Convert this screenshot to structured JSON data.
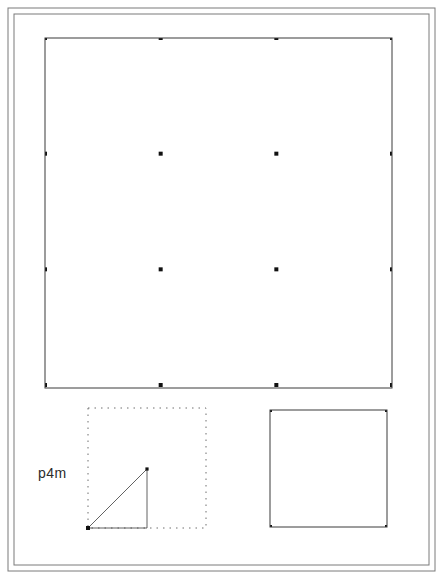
{
  "plate": {
    "title": "Islamic geometric pattern plate",
    "background_color": "#ffffff",
    "ink_color": "#3a3a3a",
    "frame": {
      "name": "double-rule-border",
      "outer": {
        "x": 8,
        "y": 8,
        "width": 427,
        "height": 563
      },
      "inner": {
        "x": 14,
        "y": 14,
        "width": 415,
        "height": 551
      },
      "stroke_color": "#7a7a7a",
      "stroke_width": 1
    }
  },
  "symmetry": {
    "group_label": "p4m",
    "label_position": {
      "x": 38,
      "y": 465
    }
  },
  "main_panel": {
    "name": "tiled-pattern-panel",
    "x": 45,
    "y": 38,
    "width": 347,
    "height": 350,
    "cells_across": 3,
    "cells_down": 3,
    "cell_size": 115.67,
    "border_stroke": "#3a3a3a"
  },
  "cell_panel": {
    "name": "unit-cell-panel",
    "x": 270,
    "y": 410,
    "width": 117,
    "height": 117,
    "label": "unit cell",
    "border_stroke": "#3a3a3a"
  },
  "domain_panel": {
    "name": "fundamental-domain-panel",
    "x": 88,
    "y": 408,
    "width": 118,
    "height": 120,
    "border_style": "dotted",
    "border_stroke": "#6e6e6e",
    "note": "dotted square enclosing the fundamental domain triangle"
  },
  "pattern_geometry": {
    "type": "rosette-tiling",
    "corner_rosette_spokes": 16,
    "center_rosette_spokes": 16,
    "edge_rosette_spokes": 12,
    "ring_radii_fraction": [
      0.12,
      0.2,
      0.29,
      0.38,
      0.47
    ],
    "node_marker_size": 4,
    "line_width": 0.55
  },
  "chart_data": {
    "type": "table",
    "categories": [
      "main pattern",
      "fundamental domain",
      "unit cell"
    ],
    "values": [
      9,
      1,
      1
    ],
    "xlabel": "panel",
    "ylabel": "cell count"
  }
}
